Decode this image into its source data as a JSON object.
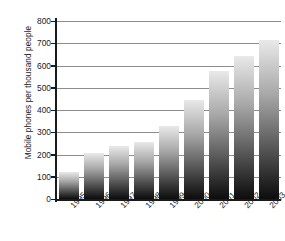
{
  "chart_data": {
    "type": "bar",
    "title": "",
    "xlabel": "",
    "ylabel": "Mobile phones per thousand people",
    "categories": [
      "1995",
      "1996",
      "1997",
      "1998",
      "1999",
      "2000",
      "2001",
      "2002",
      "2003"
    ],
    "values": [
      120,
      205,
      240,
      258,
      330,
      445,
      575,
      645,
      715
    ],
    "ylim": [
      0,
      800
    ],
    "ytick_step": 100,
    "ytick_labels": [
      "800",
      "700",
      "600",
      "500",
      "400",
      "300",
      "200",
      "100",
      "0"
    ],
    "ytick_values": [
      800,
      700,
      600,
      500,
      400,
      300,
      200,
      100,
      0
    ],
    "grid": true,
    "grid_axis": "y",
    "legend": false,
    "legend_position": "none",
    "xtick_rotation": -45,
    "bar_fill": "vertical-gradient-light-top-to-black-bottom",
    "colors": {
      "bar_top": "#e9e9e9",
      "bar_bottom": "#0d0d0d",
      "axis": "#1a1a1a",
      "gridline": "#8d8d8d",
      "background": "#ffffff",
      "text": "#1a1a1a"
    }
  }
}
